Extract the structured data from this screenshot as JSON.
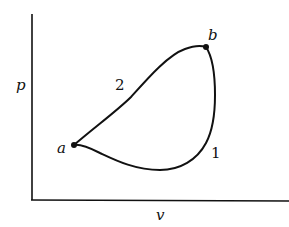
{
  "diagram": {
    "type": "pv-cycle",
    "axes": {
      "x_label": "v",
      "y_label": "p"
    },
    "points": [
      {
        "id": "a",
        "label": "a"
      },
      {
        "id": "b",
        "label": "b"
      }
    ],
    "paths": [
      {
        "id": "path-1",
        "label": "1",
        "from": "a",
        "to": "b"
      },
      {
        "id": "path-2",
        "label": "2",
        "from": "a",
        "to": "b"
      }
    ]
  }
}
